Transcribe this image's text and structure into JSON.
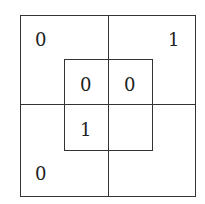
{
  "diagram": {
    "outer": {
      "top_left": "0",
      "top_right": "1",
      "bottom_left": "0",
      "bottom_right": ""
    },
    "inner": {
      "top_left": "0",
      "top_right": "0",
      "bottom_left": "1",
      "bottom_right": ""
    }
  }
}
